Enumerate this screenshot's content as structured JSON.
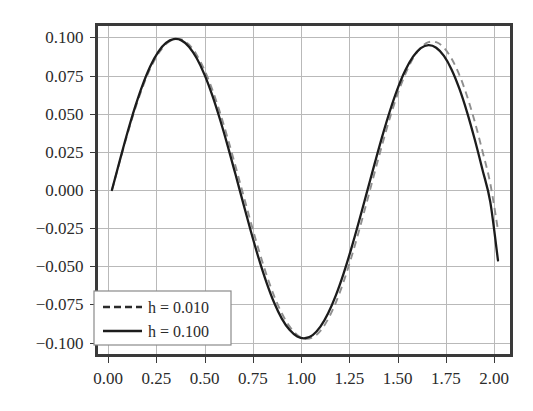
{
  "chart_data": {
    "type": "line",
    "title": "",
    "xlabel": "",
    "ylabel": "",
    "xlim": [
      -0.06,
      2.09
    ],
    "ylim": [
      -0.1085,
      0.1085
    ],
    "grid": true,
    "legend_position": "lower-left",
    "xticks": [
      0.0,
      0.25,
      0.5,
      0.75,
      1.0,
      1.25,
      1.5,
      1.75,
      2.0
    ],
    "xtick_labels": [
      "0.00",
      "0.25",
      "0.50",
      "0.75",
      "1.00",
      "1.25",
      "1.50",
      "1.75",
      "2.00"
    ],
    "yticks": [
      0.1,
      0.075,
      0.05,
      0.025,
      0.0,
      -0.025,
      -0.05,
      -0.075,
      -0.1
    ],
    "ytick_labels": [
      "0.100",
      "0.075",
      "0.050",
      "0.025",
      "0.000",
      "−0.025",
      "−0.050",
      "−0.075",
      "−0.100"
    ],
    "series": [
      {
        "name": "h = 0.010",
        "style": "dashed",
        "color": "#8f8f8f",
        "x": [
          0.02,
          0.06,
          0.1,
          0.14,
          0.18,
          0.22,
          0.26,
          0.3,
          0.34,
          0.38,
          0.42,
          0.46,
          0.5,
          0.54,
          0.58,
          0.62,
          0.66,
          0.7,
          0.74,
          0.78,
          0.82,
          0.86,
          0.9,
          0.94,
          0.98,
          1.02,
          1.06,
          1.1,
          1.14,
          1.18,
          1.22,
          1.26,
          1.3,
          1.34,
          1.38,
          1.42,
          1.46,
          1.5,
          1.54,
          1.58,
          1.62,
          1.66,
          1.7,
          1.74,
          1.78,
          1.82,
          1.86,
          1.9,
          1.94,
          1.98,
          2.02
        ],
        "y": [
          0.0,
          0.0185,
          0.0365,
          0.0531,
          0.0678,
          0.08,
          0.0893,
          0.0956,
          0.0988,
          0.0987,
          0.0952,
          0.0884,
          0.0785,
          0.0658,
          0.0507,
          0.0338,
          0.0157,
          -0.0029,
          -0.0214,
          -0.0391,
          -0.0553,
          -0.0694,
          -0.0808,
          -0.0894,
          -0.095,
          -0.0975,
          -0.0966,
          -0.0923,
          -0.0846,
          -0.0738,
          -0.0602,
          -0.0443,
          -0.0267,
          -0.0081,
          0.011,
          0.0297,
          0.0473,
          0.0629,
          0.076,
          0.0863,
          0.0933,
          0.0969,
          0.0969,
          0.0933,
          0.086,
          0.0754,
          0.0615,
          0.0446,
          0.0253,
          0.0043,
          -0.0262
        ]
      },
      {
        "name": "h = 0.100",
        "style": "solid",
        "color": "#1c1c1c",
        "x": [
          0.02,
          0.06,
          0.1,
          0.14,
          0.18,
          0.22,
          0.26,
          0.3,
          0.34,
          0.38,
          0.42,
          0.46,
          0.5,
          0.54,
          0.58,
          0.62,
          0.66,
          0.7,
          0.74,
          0.78,
          0.82,
          0.86,
          0.9,
          0.94,
          0.98,
          1.02,
          1.06,
          1.1,
          1.14,
          1.18,
          1.22,
          1.26,
          1.3,
          1.34,
          1.38,
          1.42,
          1.46,
          1.5,
          1.54,
          1.58,
          1.62,
          1.66,
          1.7,
          1.74,
          1.78,
          1.82,
          1.86,
          1.9,
          1.94,
          1.98,
          2.02
        ],
        "y": [
          0.0,
          0.019,
          0.0375,
          0.0545,
          0.0693,
          0.0815,
          0.0906,
          0.0964,
          0.0989,
          0.0981,
          0.0938,
          0.0862,
          0.0755,
          0.062,
          0.0462,
          0.0288,
          0.0103,
          -0.0086,
          -0.0272,
          -0.0447,
          -0.0604,
          -0.0738,
          -0.0843,
          -0.0917,
          -0.096,
          -0.0972,
          -0.0951,
          -0.0896,
          -0.0808,
          -0.0691,
          -0.0548,
          -0.0384,
          -0.0205,
          -0.0019,
          0.0168,
          0.035,
          0.0518,
          0.0665,
          0.0785,
          0.0874,
          0.093,
          0.095,
          0.0933,
          0.0879,
          0.0789,
          0.0664,
          0.0509,
          0.0329,
          0.0131,
          -0.0078,
          -0.0462
        ]
      }
    ],
    "legend": [
      {
        "label": "h = 0.010",
        "style": "dashed"
      },
      {
        "label": "h = 0.100",
        "style": "solid"
      }
    ]
  },
  "colors": {
    "background": "#ffffff",
    "grid": "#b9b9b9",
    "frame": "#3a3a3a",
    "solid_series": "#1c1c1c",
    "dashed_series": "#8f8f8f"
  }
}
